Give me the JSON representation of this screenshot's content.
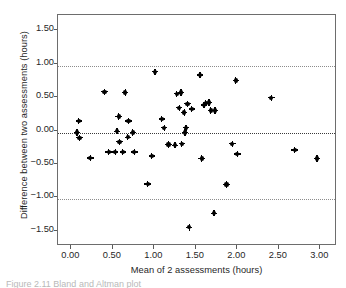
{
  "figure": {
    "caption_fragment": "Figure 2.11 Bland and Altman plot"
  },
  "chart_data": {
    "type": "scatter",
    "title": "",
    "xlabel": "Mean of 2 assessments (hours)",
    "ylabel": "Difference between two assessments (hours)",
    "xlim": [
      -0.16,
      3.2
    ],
    "ylim": [
      -1.73,
      1.73
    ],
    "xticks": [
      0.0,
      0.5,
      1.0,
      1.5,
      2.0,
      2.5,
      3.0
    ],
    "xticklabels": [
      "0.00",
      "0.50",
      "1.00",
      "1.50",
      "2.00",
      "2.50",
      "3.00"
    ],
    "yticks": [
      1.5,
      1.0,
      0.5,
      0.0,
      -0.5,
      -1.0,
      -1.5
    ],
    "yticklabels": [
      "1.50",
      "1.00",
      "0.50",
      "0.00",
      "−0.50",
      "−1.00",
      "−1.50"
    ],
    "grid": false,
    "legend": "none",
    "marker": "diamond-dot",
    "marker_color": "#000000",
    "frame_color": "#6d6d6d",
    "reference_lines": [
      {
        "name": "upper-limit-of-agreement",
        "value": 0.96,
        "style": "dotted",
        "color": "#8c8c8c"
      },
      {
        "name": "mean-difference",
        "value": -0.03,
        "style": "dotted",
        "color": "#3a3a3a"
      },
      {
        "name": "lower-limit-of-agreement",
        "value": -1.02,
        "style": "dotted",
        "color": "#8c8c8c"
      }
    ],
    "x": [
      0.07,
      0.09,
      0.1,
      0.23,
      0.4,
      0.45,
      0.53,
      0.55,
      0.57,
      0.58,
      0.62,
      0.65,
      0.68,
      0.69,
      0.74,
      0.76,
      0.92,
      0.97,
      1.01,
      1.09,
      1.12,
      1.17,
      1.25,
      1.27,
      1.3,
      1.32,
      1.33,
      1.36,
      1.37,
      1.38,
      1.4,
      1.42,
      1.45,
      1.55,
      1.57,
      1.6,
      1.62,
      1.66,
      1.68,
      1.72,
      1.73,
      1.87,
      1.94,
      1.98,
      2.0,
      2.41,
      2.69,
      2.96
    ],
    "y": [
      -0.03,
      0.14,
      -0.11,
      -0.41,
      0.58,
      -0.32,
      -0.32,
      -0.01,
      0.21,
      -0.17,
      -0.32,
      0.57,
      -0.1,
      0.14,
      -0.03,
      -0.32,
      -0.8,
      -0.38,
      0.88,
      0.17,
      0.04,
      -0.21,
      -0.22,
      0.55,
      0.34,
      0.57,
      -0.2,
      0.27,
      -0.03,
      0.04,
      0.4,
      -1.45,
      0.32,
      0.83,
      -0.42,
      0.38,
      0.41,
      0.42,
      0.3,
      -1.24,
      0.3,
      -0.81,
      -0.2,
      0.75,
      -0.35,
      0.49,
      -0.29,
      -0.42
    ]
  }
}
